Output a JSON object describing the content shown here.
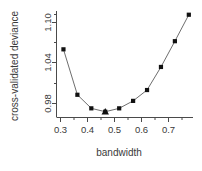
{
  "chart_data": {
    "type": "line",
    "title": "",
    "subtitle": "",
    "xlabel": "bandwidth",
    "ylabel": "cross-validated deviance",
    "x": [
      0.3,
      0.35,
      0.4,
      0.45,
      0.5,
      0.55,
      0.6,
      0.65,
      0.7,
      0.75
    ],
    "values": [
      1.072,
      1.005,
      0.985,
      0.98,
      0.985,
      0.996,
      1.012,
      1.046,
      1.084,
      1.123
    ],
    "series": [
      {
        "name": "cross-validated deviance",
        "values": [
          1.072,
          1.005,
          0.985,
          0.98,
          0.985,
          0.996,
          1.012,
          1.046,
          1.084,
          1.123
        ],
        "marker": "filled-square",
        "line": "solid"
      }
    ],
    "highlight": {
      "marker": "filled-triangle",
      "x": 0.45,
      "y": 0.98,
      "note": "minimum"
    },
    "xlim": [
      0.275,
      0.765
    ],
    "ylim": [
      0.9715,
      1.1285
    ],
    "xticks": [
      0.3,
      0.4,
      0.5,
      0.6,
      0.7
    ],
    "xticklabels": [
      "0.3",
      "0.4",
      "0.5",
      "0.6",
      "0.7"
    ],
    "xminorticks": [
      0.35,
      0.45,
      0.55,
      0.65,
      0.75
    ],
    "yticks": [
      0.98,
      1.04,
      1.1
    ],
    "yticklabels": [
      "0.98",
      "1.04",
      "1.10"
    ],
    "yminorticks": [
      1.01,
      1.07
    ],
    "grid": false,
    "legend": false,
    "legend_position": "none",
    "colors": {
      "marker": "#111111",
      "line": "#6e6e6e",
      "axis": "#4a4a4a",
      "text": "#3a3a3a",
      "background": "#ffffff"
    }
  },
  "labels": {
    "xaxis_title": "bandwidth",
    "yaxis_title": "cross-validated deviance",
    "ytick_0": "0.98",
    "ytick_1": "1.04",
    "ytick_2": "1.10",
    "xtick_0": "0.3",
    "xtick_1": "0.4",
    "xtick_2": "0.5",
    "xtick_3": "0.6",
    "xtick_4": "0.7"
  }
}
